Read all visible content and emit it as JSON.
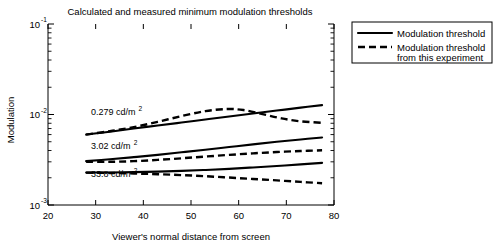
{
  "chart_data": {
    "type": "line",
    "title": "Calculated and measured minimum modulation thresholds",
    "xlabel": "Viewer's normal distance from screen",
    "ylabel": "Modulation",
    "xlim": [
      20,
      80
    ],
    "ylim": [
      0.001,
      0.1
    ],
    "yscale": "log",
    "grid": false,
    "xticks": [
      20,
      30,
      40,
      50,
      60,
      70,
      80
    ],
    "xtick_labels": [
      "20",
      "30",
      "40",
      "50",
      "60",
      "70",
      "80"
    ],
    "yticks": [
      0.001,
      0.01,
      0.1
    ],
    "ytick_labels": [
      "10",
      "10",
      "10"
    ],
    "ytick_exponents": [
      "-3",
      "-2",
      "-1"
    ],
    "legend": {
      "position": "upper right outside",
      "entries": [
        {
          "label": "Modulation threshold",
          "style": "solid"
        },
        {
          "label": "Modulation threshold",
          "label2": "from this experiment",
          "style": "dashed"
        }
      ]
    },
    "annotations": [
      {
        "text": "0.279 cd/m",
        "sup": "2",
        "x": 29.0,
        "y": 0.0098
      },
      {
        "text": "3.02 cd/m",
        "sup": "2",
        "x": 29.0,
        "y": 0.0042
      },
      {
        "text": "33.8 cd/m",
        "sup": "2",
        "x": 29.0,
        "y": 0.00205
      }
    ],
    "series": [
      {
        "name": "0.279 cd/m2 calculated",
        "style": "solid",
        "x": [
          28.0,
          33.0,
          38.0,
          43.0,
          48.0,
          53.0,
          58.0,
          63.0,
          68.0,
          73.0,
          77.5
        ],
        "y": [
          0.006,
          0.00645,
          0.007,
          0.00755,
          0.00815,
          0.0088,
          0.0095,
          0.01025,
          0.01105,
          0.0119,
          0.0127
        ]
      },
      {
        "name": "0.279 cd/m2 measured",
        "style": "dashed",
        "x": [
          28.0,
          33.0,
          38.0,
          43.0,
          48.0,
          53.0,
          57.5,
          61.0,
          65.0,
          69.0,
          73.0,
          77.5
        ],
        "y": [
          0.006,
          0.00655,
          0.00725,
          0.0083,
          0.0096,
          0.0109,
          0.0115,
          0.0112,
          0.0101,
          0.00905,
          0.0084,
          0.0081
        ]
      },
      {
        "name": "3.02 cd/m2 calculated",
        "style": "solid",
        "x": [
          28.0,
          33.0,
          38.0,
          43.0,
          48.0,
          53.0,
          58.0,
          63.0,
          68.0,
          73.0,
          77.5
        ],
        "y": [
          0.00305,
          0.0032,
          0.00338,
          0.00358,
          0.00382,
          0.00408,
          0.00437,
          0.00468,
          0.005,
          0.0053,
          0.00558
        ]
      },
      {
        "name": "3.02 cd/m2 measured",
        "style": "dashed",
        "x": [
          28.0,
          33.0,
          38.0,
          43.0,
          48.0,
          53.0,
          58.0,
          63.0,
          68.0,
          73.0,
          77.5
        ],
        "y": [
          0.003,
          0.003,
          0.00305,
          0.00315,
          0.00328,
          0.00343,
          0.00358,
          0.00372,
          0.00385,
          0.00395,
          0.00402
        ]
      },
      {
        "name": "33.8 cd/m2 calculated",
        "style": "solid",
        "x": [
          28.0,
          33.0,
          38.0,
          43.0,
          48.0,
          53.0,
          58.0,
          63.0,
          68.0,
          73.0,
          77.5
        ],
        "y": [
          0.00228,
          0.00229,
          0.00231,
          0.00234,
          0.00238,
          0.00244,
          0.00251,
          0.0026,
          0.0027,
          0.00281,
          0.00292
        ]
      },
      {
        "name": "33.8 cd/m2 measured",
        "style": "dashed",
        "x": [
          28.0,
          33.0,
          38.0,
          43.0,
          48.0,
          53.0,
          58.0,
          63.0,
          68.0,
          73.0,
          77.5
        ],
        "y": [
          0.00228,
          0.00226,
          0.00223,
          0.00219,
          0.00214,
          0.00208,
          0.00201,
          0.00194,
          0.00187,
          0.0018,
          0.00174
        ]
      }
    ]
  },
  "colors": {
    "ink": "#000000",
    "background": "#ffffff"
  }
}
